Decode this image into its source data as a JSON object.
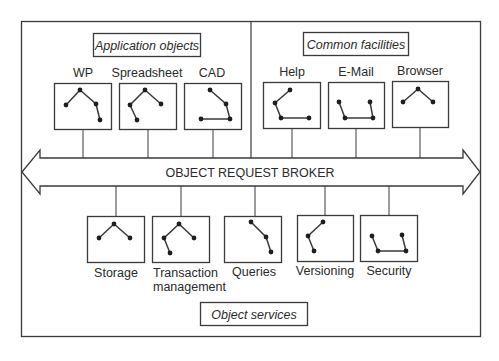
{
  "diagram": {
    "bus": {
      "label": "OBJECT REQUEST BROKER"
    },
    "groups": [
      {
        "id": "application-objects",
        "label": "Application objects"
      },
      {
        "id": "common-facilities",
        "label": "Common facilities"
      },
      {
        "id": "object-services",
        "label": "Object services"
      }
    ],
    "objects": [
      {
        "group": "application-objects",
        "label": "WP",
        "label2": ""
      },
      {
        "group": "application-objects",
        "label": "Spreadsheet",
        "label2": ""
      },
      {
        "group": "application-objects",
        "label": "CAD",
        "label2": ""
      },
      {
        "group": "common-facilities",
        "label": "Help",
        "label2": ""
      },
      {
        "group": "common-facilities",
        "label": "E-Mail",
        "label2": ""
      },
      {
        "group": "common-facilities",
        "label": "Browser",
        "label2": ""
      },
      {
        "group": "object-services",
        "label": "Storage",
        "label2": ""
      },
      {
        "group": "object-services",
        "label": "Transaction",
        "label2": "management"
      },
      {
        "group": "object-services",
        "label": "Queries",
        "label2": ""
      },
      {
        "group": "object-services",
        "label": "Versioning",
        "label2": ""
      },
      {
        "group": "object-services",
        "label": "Security",
        "label2": ""
      }
    ],
    "colors": {
      "line": "#3a3a3a",
      "node": "#1e1e1e",
      "text": "#2a2a2a",
      "background": "#ffffff"
    }
  }
}
